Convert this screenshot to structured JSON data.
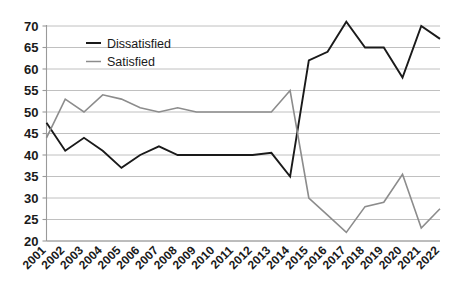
{
  "chart_data": {
    "type": "line",
    "title": "",
    "subtitle": "",
    "xlabel": "",
    "ylabel": "",
    "xlim": [
      2001,
      2022
    ],
    "ylim": [
      20,
      70
    ],
    "ytick_step": 5,
    "grid": true,
    "legend_position": "top-left-inside",
    "categories": [
      "2001",
      "2002",
      "2003",
      "2004",
      "2005",
      "2006",
      "2007",
      "2008",
      "2009",
      "2010",
      "2011",
      "2012",
      "2013",
      "2014",
      "2015",
      "2016",
      "2017",
      "2018",
      "2019",
      "2020",
      "2021",
      "2022"
    ],
    "x": [
      2001,
      2002,
      2003,
      2004,
      2005,
      2006,
      2007,
      2008,
      2009,
      2010,
      2011,
      2012,
      2013,
      2014,
      2015,
      2016,
      2017,
      2018,
      2019,
      2020,
      2021,
      2022
    ],
    "yticks": [
      20,
      25,
      30,
      35,
      40,
      45,
      50,
      55,
      60,
      65,
      70
    ],
    "ytick_labels": [
      "20",
      "25",
      "30",
      "35",
      "40",
      "45",
      "50",
      "55",
      "60",
      "65",
      "70"
    ],
    "series": [
      {
        "name": "Dissatisfied",
        "color": "#1a1a1a",
        "width": 1.9,
        "values": [
          47.5,
          41,
          44,
          41,
          37,
          40,
          42,
          40,
          40,
          40,
          40,
          40,
          40.5,
          35,
          62,
          64,
          71,
          65,
          65,
          58,
          70,
          67
        ]
      },
      {
        "name": "Satisfied",
        "color": "#8c8c8c",
        "width": 1.6,
        "values": [
          44,
          53,
          50,
          54,
          53,
          51,
          50,
          51,
          50,
          50,
          50,
          50,
          50,
          55,
          30,
          26,
          22,
          28,
          29,
          35.5,
          23,
          27.5
        ]
      }
    ]
  },
  "legend": {
    "items": [
      {
        "label": "Dissatisfied",
        "color": "#1a1a1a",
        "swatch": "line-swatch"
      },
      {
        "label": "Satisfied",
        "color": "#8c8c8c",
        "swatch": "line-swatch"
      }
    ]
  }
}
